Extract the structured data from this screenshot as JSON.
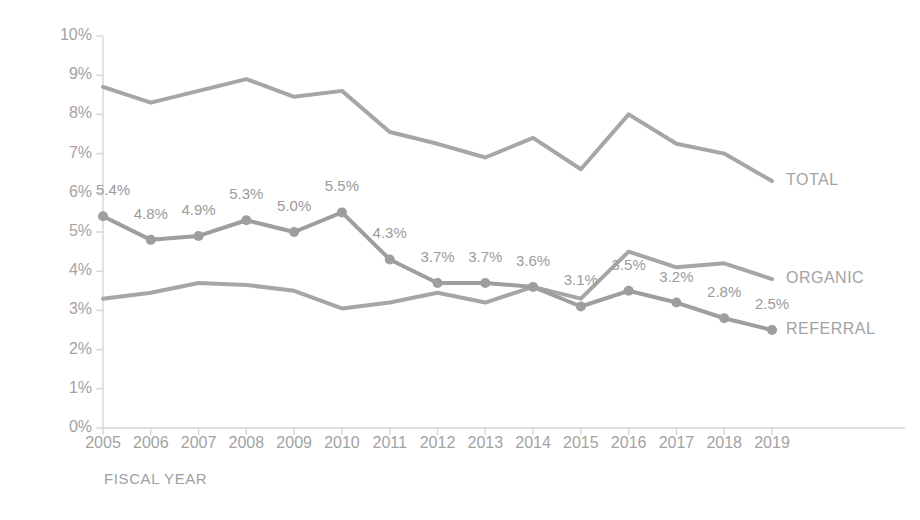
{
  "chart_data": {
    "type": "line",
    "title": "",
    "xlabel": "FISCAL YEAR",
    "ylabel": "CONVERSION RATE",
    "categories": [
      "2005",
      "2006",
      "2007",
      "2008",
      "2009",
      "2010",
      "2011",
      "2012",
      "2013",
      "2014",
      "2015",
      "2016",
      "2017",
      "2018",
      "2019"
    ],
    "ylim": [
      0,
      10
    ],
    "ytick_labels": [
      "0%",
      "1%",
      "2%",
      "3%",
      "4%",
      "5%",
      "6%",
      "7%",
      "8%",
      "9%",
      "10%"
    ],
    "ytick_values": [
      0,
      1,
      2,
      3,
      4,
      5,
      6,
      7,
      8,
      9,
      10
    ],
    "grid": false,
    "legend_position": "right-inline",
    "series": [
      {
        "name": "TOTAL",
        "color": "#a6a6a6",
        "markers": false,
        "labelled": false,
        "values": [
          8.7,
          8.3,
          8.6,
          8.9,
          8.45,
          8.6,
          7.55,
          7.25,
          6.9,
          7.4,
          6.6,
          8.0,
          7.25,
          7.0,
          6.3
        ]
      },
      {
        "name": "ORGANIC",
        "color": "#a6a6a6",
        "markers": false,
        "labelled": false,
        "values": [
          3.3,
          3.45,
          3.7,
          3.65,
          3.5,
          3.05,
          3.2,
          3.45,
          3.2,
          3.6,
          3.3,
          4.5,
          4.1,
          4.2,
          3.8
        ]
      },
      {
        "name": "REFERRAL",
        "color": "#9e9e9e",
        "markers": true,
        "labelled": true,
        "values": [
          5.4,
          4.8,
          4.9,
          5.3,
          5.0,
          5.5,
          4.3,
          3.7,
          3.7,
          3.6,
          3.1,
          3.5,
          3.2,
          2.8,
          2.5
        ],
        "point_labels": [
          "5.4%",
          "4.8%",
          "4.9%",
          "5.3%",
          "5.0%",
          "5.5%",
          "4.3%",
          "3.7%",
          "3.7%",
          "3.6%",
          "3.1%",
          "3.5%",
          "3.2%",
          "2.8%",
          "2.5%"
        ]
      }
    ]
  },
  "axis": {
    "axis_color": "#d6d6d6",
    "text_color": "#a3a3a3"
  }
}
